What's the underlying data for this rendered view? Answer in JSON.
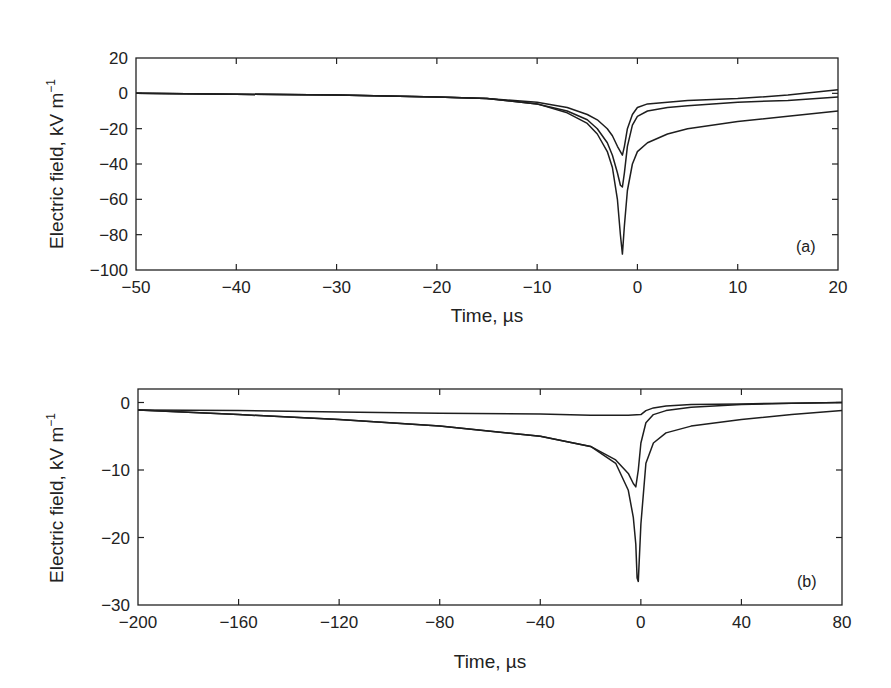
{
  "chart_data": [
    {
      "type": "line",
      "panel": "(a)",
      "xlabel": "Time, µs",
      "ylabel": "Electric field, kV m⁻¹",
      "xlim": [
        -50,
        20
      ],
      "ylim": [
        -100,
        20
      ],
      "xticks": [
        -50,
        -40,
        -30,
        -20,
        -10,
        0,
        10,
        20
      ],
      "yticks": [
        20,
        0,
        -20,
        -40,
        -60,
        -80,
        -100
      ],
      "xtick_labels": [
        "−50",
        "−40",
        "−30",
        "−20",
        "−10",
        "0",
        "10",
        "20"
      ],
      "ytick_labels": [
        "20",
        "0",
        "−20",
        "−40",
        "−60",
        "−80",
        "−100"
      ],
      "grid": false,
      "legend": null,
      "series": [
        {
          "name": "trace-1",
          "x": [
            -50,
            -40,
            -30,
            -20,
            -15,
            -10,
            -7,
            -5,
            -4,
            -3,
            -2.5,
            -2,
            -1.7,
            -1.5,
            -1.3,
            -1,
            -0.5,
            0,
            1,
            3,
            5,
            10,
            15,
            20
          ],
          "y": [
            0,
            -0.5,
            -1,
            -2,
            -3,
            -5,
            -8,
            -12,
            -15,
            -20,
            -24,
            -30,
            -33,
            -35,
            -30,
            -20,
            -12,
            -8,
            -6,
            -5,
            -4,
            -3,
            -1,
            2
          ]
        },
        {
          "name": "trace-2",
          "x": [
            -50,
            -40,
            -30,
            -20,
            -15,
            -10,
            -7,
            -5,
            -4,
            -3,
            -2.5,
            -2,
            -1.7,
            -1.5,
            -1.3,
            -1,
            -0.5,
            0,
            1,
            3,
            5,
            10,
            15,
            20
          ],
          "y": [
            0,
            -0.5,
            -1,
            -2,
            -3,
            -6,
            -10,
            -15,
            -20,
            -28,
            -35,
            -45,
            -52,
            -53,
            -45,
            -30,
            -18,
            -13,
            -10,
            -8,
            -7,
            -5,
            -4,
            -2
          ]
        },
        {
          "name": "trace-3",
          "x": [
            -50,
            -40,
            -30,
            -20,
            -15,
            -10,
            -7,
            -5,
            -4,
            -3,
            -2.5,
            -2,
            -1.7,
            -1.5,
            -1.3,
            -1,
            -0.5,
            0,
            1,
            3,
            5,
            10,
            15,
            20
          ],
          "y": [
            0,
            -0.5,
            -1,
            -2,
            -3,
            -6,
            -11,
            -17,
            -23,
            -33,
            -42,
            -60,
            -80,
            -91,
            -75,
            -55,
            -40,
            -33,
            -28,
            -23,
            -20,
            -16,
            -13,
            -10
          ]
        }
      ],
      "annotations": [
        "(a)"
      ]
    },
    {
      "type": "line",
      "panel": "(b)",
      "xlabel": "Time, µs",
      "ylabel": "Electric field, kV m⁻¹",
      "xlim": [
        -200,
        80
      ],
      "ylim": [
        -30,
        2
      ],
      "xticks": [
        -200,
        -160,
        -120,
        -80,
        -40,
        0,
        40,
        80
      ],
      "yticks": [
        0,
        -10,
        -20,
        -30
      ],
      "xtick_labels": [
        "−200",
        "−160",
        "−120",
        "−80",
        "−40",
        "0",
        "40",
        "80"
      ],
      "ytick_labels": [
        "0",
        "−10",
        "−20",
        "−30"
      ],
      "grid": false,
      "legend": null,
      "series": [
        {
          "name": "trace-1",
          "x": [
            -200,
            -160,
            -120,
            -80,
            -40,
            -20,
            -5,
            0,
            2,
            5,
            10,
            20,
            40,
            60,
            80
          ],
          "y": [
            -1.1,
            -1.2,
            -1.4,
            -1.6,
            -1.7,
            -1.9,
            -1.9,
            -1.8,
            -1.2,
            -0.8,
            -0.5,
            -0.3,
            -0.2,
            -0.1,
            0
          ]
        },
        {
          "name": "trace-2",
          "x": [
            -200,
            -160,
            -120,
            -80,
            -40,
            -20,
            -10,
            -5,
            -3,
            -2,
            -1,
            0,
            2,
            5,
            10,
            20,
            40,
            60,
            80
          ],
          "y": [
            -1.1,
            -1.8,
            -2.5,
            -3.5,
            -5,
            -6.5,
            -8.5,
            -10.5,
            -12,
            -12.5,
            -10,
            -6,
            -3,
            -1.8,
            -1.2,
            -0.7,
            -0.3,
            -0.1,
            0
          ]
        },
        {
          "name": "trace-3",
          "x": [
            -200,
            -160,
            -120,
            -80,
            -40,
            -20,
            -10,
            -5,
            -3,
            -2,
            -1.5,
            -1,
            0,
            2,
            5,
            10,
            20,
            40,
            60,
            80
          ],
          "y": [
            -1.1,
            -1.8,
            -2.5,
            -3.5,
            -5,
            -6.5,
            -9,
            -13,
            -17,
            -21,
            -26,
            -26.5,
            -18,
            -9,
            -6,
            -4.5,
            -3.5,
            -2.5,
            -1.8,
            -1.2
          ]
        }
      ],
      "annotations": [
        "(b)"
      ]
    }
  ],
  "panels": {
    "a": {
      "tag": "(a)",
      "xlabel": "Time, µs",
      "ylabel": "Electric field, kV m",
      "ylabel_sup": "−1"
    },
    "b": {
      "tag": "(b)",
      "xlabel": "Time, µs",
      "ylabel": "Electric field, kV m",
      "ylabel_sup": "−1"
    }
  }
}
